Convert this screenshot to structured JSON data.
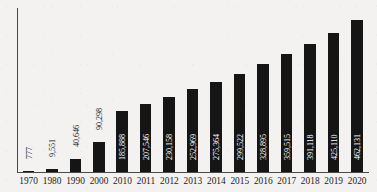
{
  "chart_data": {
    "type": "bar",
    "title": "",
    "subtitle": "",
    "xlabel": "",
    "ylabel": "",
    "grid": false,
    "legend": "none",
    "axis": {
      "y_ticks_visible": false,
      "x_tick_labels_visible": true,
      "ylim": [
        0,
        500000
      ]
    },
    "categories": [
      "1970",
      "1980",
      "1990",
      "2000",
      "2010",
      "2011",
      "2012",
      "2013",
      "2014",
      "2015",
      "2016",
      "2017",
      "2018",
      "2019",
      "2020"
    ],
    "values": [
      777,
      9551,
      40646,
      90298,
      185888,
      207546,
      230158,
      252969,
      275364,
      299522,
      328895,
      359515,
      391118,
      425110,
      462131
    ],
    "value_labels": [
      "777",
      "9,551",
      "40,646",
      "90,298",
      "185,888",
      "207,546",
      "230,158",
      "252,969",
      "275,364",
      "299,522",
      "328,895",
      "359,515",
      "391,118",
      "425,110",
      "462,131"
    ],
    "label_placement": [
      "outside",
      "outside",
      "outside",
      "outside",
      "inside",
      "inside",
      "inside",
      "inside",
      "inside",
      "inside",
      "inside",
      "inside",
      "inside",
      "inside",
      "inside"
    ],
    "colors": {
      "bar": "#151515",
      "background": "#f3f2f0",
      "axis": "#4a4a4a",
      "label_inside": "#ffffff",
      "label_outside": "#1a1a1a"
    }
  }
}
